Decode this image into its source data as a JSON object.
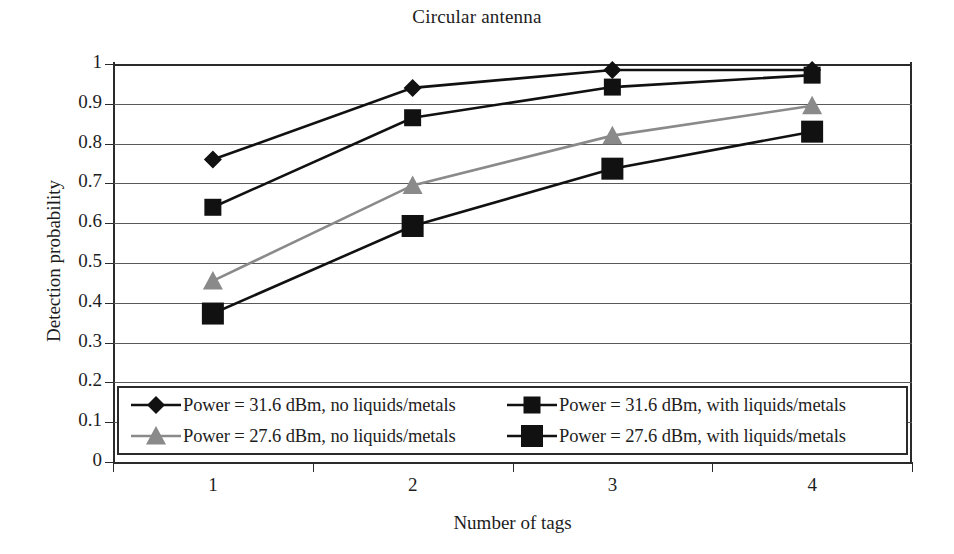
{
  "chart_data": {
    "type": "line",
    "title": "Circular antenna",
    "xlabel": "Number of tags",
    "ylabel": "Detection probability",
    "categories": [
      "1",
      "2",
      "3",
      "4"
    ],
    "ylim": [
      0,
      1
    ],
    "yticks": [
      "1",
      "0.9",
      "0.8",
      "0.7",
      "0.6",
      "0.5",
      "0.4",
      "0.3",
      "0.2",
      "0.1",
      "0"
    ],
    "ytick_values": [
      1,
      0.9,
      0.8,
      0.7,
      0.6,
      0.5,
      0.4,
      0.3,
      0.2,
      0.1,
      0
    ],
    "grid": true,
    "legend_position": "inside-bottom-left",
    "series": [
      {
        "name": "Power = 31.6 dBm, no liquids/metals",
        "marker": "diamond",
        "color": "#111111",
        "line_color": "#111111",
        "values": [
          0.76,
          0.94,
          0.985,
          0.985
        ]
      },
      {
        "name": "Power = 31.6 dBm, with liquids/metals",
        "marker": "square",
        "color": "#111111",
        "line_color": "#111111",
        "values": [
          0.64,
          0.865,
          0.942,
          0.972
        ]
      },
      {
        "name": "Power = 27.6 dBm, no liquids/metals",
        "marker": "triangle",
        "color": "#8a8a8a",
        "line_color": "#8a8a8a",
        "values": [
          0.455,
          0.695,
          0.82,
          0.895
        ]
      },
      {
        "name": "Power = 27.6 dBm, with liquids/metals",
        "marker": "square-large",
        "color": "#111111",
        "line_color": "#111111",
        "values": [
          0.373,
          0.593,
          0.737,
          0.83
        ]
      }
    ]
  },
  "legend": {
    "entries": [
      {
        "label": "Power = 31.6 dBm, no liquids/metals",
        "marker": "diamond",
        "color": "#111111"
      },
      {
        "label": "Power = 31.6 dBm, with liquids/metals",
        "marker": "square",
        "color": "#111111"
      },
      {
        "label": "Power = 27.6 dBm, no liquids/metals",
        "marker": "triangle",
        "color": "#8a8a8a"
      },
      {
        "label": "Power = 27.6 dBm, with liquids/metals",
        "marker": "square-large",
        "color": "#111111"
      }
    ]
  },
  "colors": {
    "axis": "#2b2b2b",
    "grid": "#5a5a5a",
    "text": "#1d1d1d",
    "series_dark": "#111111",
    "series_gray": "#8a8a8a",
    "background": "#ffffff"
  }
}
